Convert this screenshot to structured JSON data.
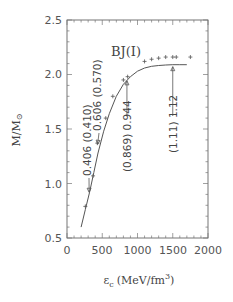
{
  "chart_data": {
    "type": "line",
    "title": "BJ(I)",
    "xlabel": "ε_c (MeV/fm³)",
    "ylabel": "M/M_⊙",
    "xlim": [
      0,
      2000
    ],
    "ylim": [
      0.5,
      2.5
    ],
    "x_ticks": [
      "0",
      "500",
      "1000",
      "1500",
      "2000"
    ],
    "y_ticks": [
      "0.5",
      "1.0",
      "1.5",
      "2.0",
      "2.5"
    ],
    "grid": false,
    "series": [
      {
        "name": "curve",
        "style": "line",
        "x": [
          200,
          260,
          320,
          380,
          440,
          520,
          600,
          700,
          800,
          900,
          1000,
          1100,
          1200,
          1300,
          1400,
          1500,
          1600,
          1700
        ],
        "y": [
          0.6,
          0.76,
          0.92,
          1.1,
          1.28,
          1.48,
          1.64,
          1.8,
          1.91,
          1.98,
          2.03,
          2.06,
          2.075,
          2.083,
          2.087,
          2.09,
          2.09,
          2.09
        ]
      },
      {
        "name": "data points",
        "style": "plus-markers",
        "x": [
          260,
          370,
          430,
          550,
          650,
          800,
          860,
          1100,
          1200,
          1300,
          1400,
          1500,
          1550,
          1750
        ],
        "y": [
          0.79,
          1.07,
          1.37,
          1.6,
          1.8,
          1.95,
          1.98,
          2.12,
          2.14,
          2.15,
          2.16,
          2.16,
          2.16,
          2.16
        ]
      }
    ],
    "annotations": [
      {
        "text": "0.406 (0.410)",
        "arrow_x": 300,
        "arrow_y": 0.92,
        "rotation": -90
      },
      {
        "text": "0.606 (0.570)",
        "arrow_x": 420,
        "arrow_y": 1.36,
        "rotation": -90
      },
      {
        "text": "(0.869) 0.944",
        "arrow_x": 850,
        "arrow_y": 1.96,
        "rotation": -90
      },
      {
        "text": "(1.11) 1.12",
        "arrow_x": 1500,
        "arrow_y": 2.09,
        "rotation": -90
      }
    ]
  },
  "plot": {
    "title": "BJ(I)",
    "xlabel_main": "ε",
    "xlabel_sub": "c",
    "xlabel_units": "(MeV/fm",
    "xlabel_sup": "3",
    "xlabel_close": ")",
    "ylabel": "M/M",
    "ylabel_sub": "⊙",
    "x_ticks": [
      "0",
      "500",
      "1000",
      "1500",
      "2000"
    ],
    "y_ticks": [
      "0.5",
      "1.0",
      "1.5",
      "2.0",
      "2.5"
    ],
    "ann1": "0.406 (0.410)",
    "ann2": "0.606 (0.570)",
    "ann3": "(0.869) 0.944",
    "ann4": "(1.11) 1.12"
  }
}
